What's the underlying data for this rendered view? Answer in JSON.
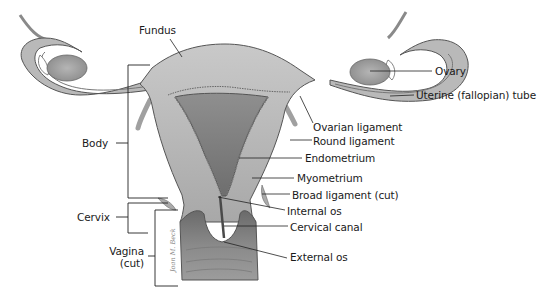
{
  "diagram": {
    "labels": {
      "fundus": "Fundus",
      "body": "Body",
      "cervix": "Cervix",
      "vagina_line1": "Vagina",
      "vagina_line2": "(cut)",
      "ovary": "Ovary",
      "uterine_tube": "Uterine (fallopian) tube",
      "ovarian_ligament": "Ovarian ligament",
      "round_ligament": "Round ligament",
      "endometrium": "Endometrium",
      "myometrium": "Myometrium",
      "broad_ligament": "Broad ligament (cut)",
      "internal_os": "Internal os",
      "cervical_canal": "Cervical canal",
      "external_os": "External os"
    },
    "signature": "Joan M. Beck"
  }
}
